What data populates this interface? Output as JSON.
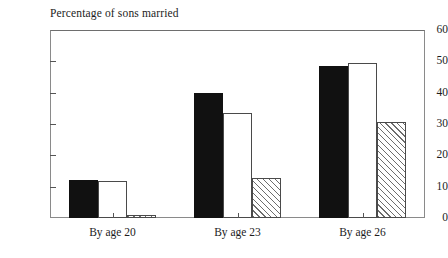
{
  "chart_data": {
    "type": "bar",
    "title": "Percentage of sons married",
    "xlabel": "",
    "ylabel": "",
    "ylim": [
      0,
      60
    ],
    "yticks": [
      0,
      10,
      20,
      30,
      40,
      50,
      60
    ],
    "grid": false,
    "legend": "none",
    "categories": [
      "By age 20",
      "By age 23",
      "By age 26"
    ],
    "series": [
      {
        "name": "solid-black",
        "fill": "solid",
        "values": [
          12,
          40,
          48.5
        ]
      },
      {
        "name": "open-white",
        "fill": "open",
        "values": [
          11.8,
          33.5,
          49.5
        ]
      },
      {
        "name": "hatched",
        "fill": "hatch",
        "values": [
          1,
          12.8,
          30.5
        ]
      }
    ]
  },
  "axis": {
    "tick_labels": [
      "60",
      "50",
      "40",
      "30",
      "20",
      "10",
      "0"
    ]
  }
}
